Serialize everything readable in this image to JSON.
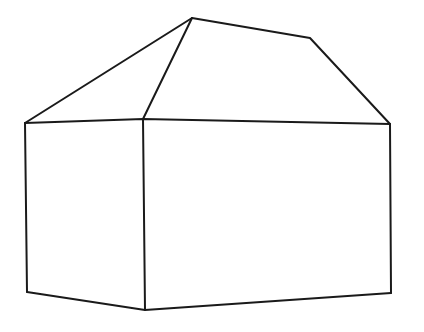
{
  "figure": {
    "style": "black outline sketch on white background",
    "background_color": "#ffffff",
    "stroke_color": "#1a1a1a",
    "stroke_width": 2,
    "canvas": {
      "width": 424,
      "height": 332
    }
  },
  "geometry": {
    "points": {
      "roof_apex": {
        "x": 192,
        "y": 18
      },
      "ridge_bend": {
        "x": 310,
        "y": 38
      },
      "eave_left": {
        "x": 25,
        "y": 123
      },
      "eave_front_corner": {
        "x": 143,
        "y": 119
      },
      "eave_right": {
        "x": 390,
        "y": 124
      },
      "base_left": {
        "x": 27,
        "y": 292
      },
      "base_front_corner": {
        "x": 145,
        "y": 310
      },
      "base_right": {
        "x": 391,
        "y": 293
      }
    },
    "paths": {
      "roof_ridge": "M 192 18 L 310 38 L 390 124",
      "roof_hip_left": "M 192 18 L 25 123",
      "roof_hip_front": "M 192 18 L 143 119",
      "eave_line": "M 25 123 L 143 119 L 390 124",
      "wall_left_edge": "M 25 123 L 27 292",
      "wall_front_corner_edge": "M 143 119 L 145 310",
      "wall_right_edge": "M 390 124 L 391 293",
      "base_line": "M 27 292 L 145 310 L 391 293"
    }
  },
  "parts": [
    {
      "id": "roof-ridge",
      "label": "Roof ridge"
    },
    {
      "id": "roof-hip-left",
      "label": "Left hip edge"
    },
    {
      "id": "roof-hip-front",
      "label": "Front hip edge"
    },
    {
      "id": "eave-line",
      "label": "Eave line"
    },
    {
      "id": "wall-left-edge",
      "label": "Left wall edge"
    },
    {
      "id": "wall-front-corner",
      "label": "Front corner edge"
    },
    {
      "id": "wall-right-edge",
      "label": "Right wall edge"
    },
    {
      "id": "base-line",
      "label": "Base line"
    }
  ]
}
